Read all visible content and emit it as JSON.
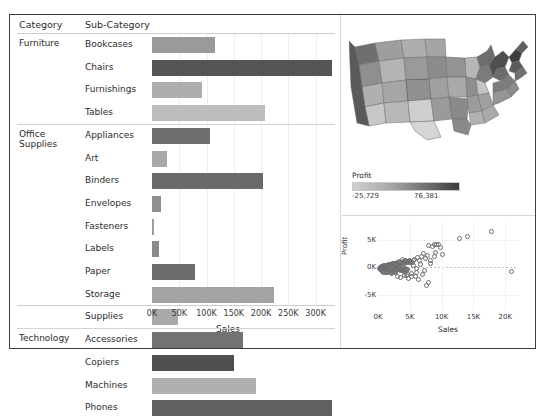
{
  "toolbar_remnant": {
    "left": "",
    "right": ""
  },
  "bar_sheet": {
    "headers": {
      "category": "Category",
      "sub_category": "Sub-Category"
    },
    "axis_title": "Sales",
    "axis_ticks": [
      "0K",
      "50K",
      "100K",
      "150K",
      "200K",
      "250K",
      "300K"
    ]
  },
  "map_sheet": {
    "legend_title": "Profit",
    "legend_min": "-25,729",
    "legend_max": "76,381"
  },
  "scatter_sheet": {
    "x_title": "Sales",
    "y_title": "Profit",
    "x_ticks": [
      "0K",
      "5K",
      "10K",
      "15K",
      "20K"
    ],
    "y_ticks": [
      "5K",
      "0K",
      "-5K"
    ]
  },
  "colors": {
    "frame": "#3d3d3d",
    "text": "#2b2b2b",
    "grid": "#eceef0",
    "bar_dark": "#4a4a4a",
    "bar_light": "#c0c0c0"
  },
  "chart_data": [
    {
      "type": "bar",
      "title": "Sales by Sub-Category",
      "xlabel": "Sales",
      "ylabel": "Sub-Category",
      "xlim": [
        0,
        330000
      ],
      "grid": true,
      "orientation": "horizontal",
      "categories": [
        "Bookcases",
        "Chairs",
        "Furnishings",
        "Tables",
        "Appliances",
        "Art",
        "Binders",
        "Envelopes",
        "Fasteners",
        "Labels",
        "Paper",
        "Storage",
        "Supplies",
        "Accessories",
        "Copiers",
        "Machines",
        "Phones"
      ],
      "groups": [
        {
          "label": "Furniture",
          "items": [
            "Bookcases",
            "Chairs",
            "Furnishings",
            "Tables"
          ]
        },
        {
          "label": "Office Supplies",
          "items": [
            "Appliances",
            "Art",
            "Binders",
            "Envelopes",
            "Fasteners",
            "Labels",
            "Paper",
            "Storage",
            "Supplies"
          ]
        },
        {
          "label": "Technology",
          "items": [
            "Accessories",
            "Copiers",
            "Machines",
            "Phones"
          ]
        }
      ],
      "values": [
        115000,
        330000,
        92000,
        207000,
        107000,
        27000,
        203000,
        17000,
        3000,
        12500,
        78000,
        223000,
        47000,
        167000,
        150000,
        190000,
        330000
      ],
      "shades": [
        "#9a9a9a",
        "#555555",
        "#aeaeae",
        "#bdbdbd",
        "#6f6f6f",
        "#a8a8a8",
        "#6a6a6a",
        "#8f8f8f",
        "#9c9c9c",
        "#8a8a8a",
        "#6c6c6c",
        "#a3a3a3",
        "#a9a9a9",
        "#727272",
        "#4f4f4f",
        "#b0b0b0",
        "#616161"
      ]
    },
    {
      "type": "heatmap",
      "subtype": "choropleth",
      "title": "Profit by State",
      "legend_title": "Profit",
      "legend_min": -25729,
      "legend_max": 76381
    },
    {
      "type": "scatter",
      "title": "Profit vs Sales",
      "xlabel": "Sales",
      "ylabel": "Profit",
      "xlim": [
        0,
        22000
      ],
      "ylim": [
        -8000,
        8000
      ],
      "grid": true,
      "points": [
        [
          300,
          -200
        ],
        [
          420,
          -120
        ],
        [
          520,
          60
        ],
        [
          380,
          -420
        ],
        [
          640,
          120
        ],
        [
          720,
          -260
        ],
        [
          560,
          -600
        ],
        [
          860,
          220
        ],
        [
          940,
          -150
        ],
        [
          700,
          -740
        ],
        [
          1100,
          260
        ],
        [
          1250,
          -80
        ],
        [
          1020,
          -520
        ],
        [
          1380,
          340
        ],
        [
          1180,
          -380
        ],
        [
          1500,
          140
        ],
        [
          1320,
          -620
        ],
        [
          1650,
          420
        ],
        [
          1450,
          -220
        ],
        [
          1780,
          -60
        ],
        [
          1600,
          -880
        ],
        [
          1900,
          500
        ],
        [
          1700,
          -420
        ],
        [
          2050,
          180
        ],
        [
          1850,
          -700
        ],
        [
          2200,
          560
        ],
        [
          2000,
          -300
        ],
        [
          2350,
          260
        ],
        [
          2150,
          -560
        ],
        [
          2500,
          620
        ],
        [
          2300,
          -180
        ],
        [
          2650,
          340
        ],
        [
          2450,
          -760
        ],
        [
          2800,
          680
        ],
        [
          2600,
          -400
        ],
        [
          2950,
          420
        ],
        [
          2750,
          -240
        ],
        [
          3100,
          740
        ],
        [
          2900,
          -620
        ],
        [
          3250,
          480
        ],
        [
          3050,
          -340
        ],
        [
          3400,
          800
        ],
        [
          3200,
          -520
        ],
        [
          3550,
          560
        ],
        [
          3350,
          -180
        ],
        [
          3700,
          860
        ],
        [
          3500,
          -700
        ],
        [
          3850,
          620
        ],
        [
          3650,
          -420
        ],
        [
          4000,
          920
        ],
        [
          3800,
          -260
        ],
        [
          4150,
          680
        ],
        [
          3950,
          -820
        ],
        [
          4300,
          980
        ],
        [
          4100,
          -540
        ],
        [
          4450,
          740
        ],
        [
          4250,
          -320
        ],
        [
          4600,
          1040
        ],
        [
          4400,
          -660
        ],
        [
          4750,
          800
        ],
        [
          4550,
          -1480
        ],
        [
          4900,
          1100
        ],
        [
          4700,
          -420
        ],
        [
          5050,
          860
        ],
        [
          3100,
          -1750
        ],
        [
          3500,
          -1900
        ],
        [
          4200,
          -1550
        ],
        [
          4600,
          -1280
        ],
        [
          5200,
          -1100
        ],
        [
          4800,
          -2050
        ],
        [
          5400,
          900
        ],
        [
          5600,
          1250
        ],
        [
          5300,
          -1650
        ],
        [
          5800,
          1420
        ],
        [
          6000,
          -980
        ],
        [
          6200,
          1680
        ],
        [
          5900,
          -1780
        ],
        [
          6500,
          1180
        ],
        [
          6800,
          1950
        ],
        [
          6400,
          -2350
        ],
        [
          7100,
          2480
        ],
        [
          7400,
          1620
        ],
        [
          7000,
          -1420
        ],
        [
          7700,
          2150
        ],
        [
          8000,
          3900
        ],
        [
          7900,
          -2800
        ],
        [
          8300,
          1250
        ],
        [
          8600,
          3650
        ],
        [
          8900,
          4050
        ],
        [
          9200,
          4150
        ],
        [
          9500,
          4020
        ],
        [
          9800,
          3480
        ],
        [
          8200,
          620
        ],
        [
          8800,
          1850
        ],
        [
          9100,
          2650
        ],
        [
          7600,
          -3450
        ],
        [
          10200,
          2200
        ],
        [
          12800,
          5150
        ],
        [
          14100,
          5600
        ],
        [
          17900,
          6450
        ],
        [
          20900,
          -900
        ],
        [
          6700,
          420
        ],
        [
          7300,
          -560
        ],
        [
          5500,
          260
        ],
        [
          6100,
          -340
        ],
        [
          4350,
          1180
        ],
        [
          3900,
          1420
        ],
        [
          3300,
          1050
        ],
        [
          2700,
          -1050
        ],
        [
          2100,
          -1180
        ],
        [
          1550,
          -1020
        ],
        [
          1150,
          -940
        ],
        [
          820,
          -1050
        ]
      ]
    }
  ]
}
